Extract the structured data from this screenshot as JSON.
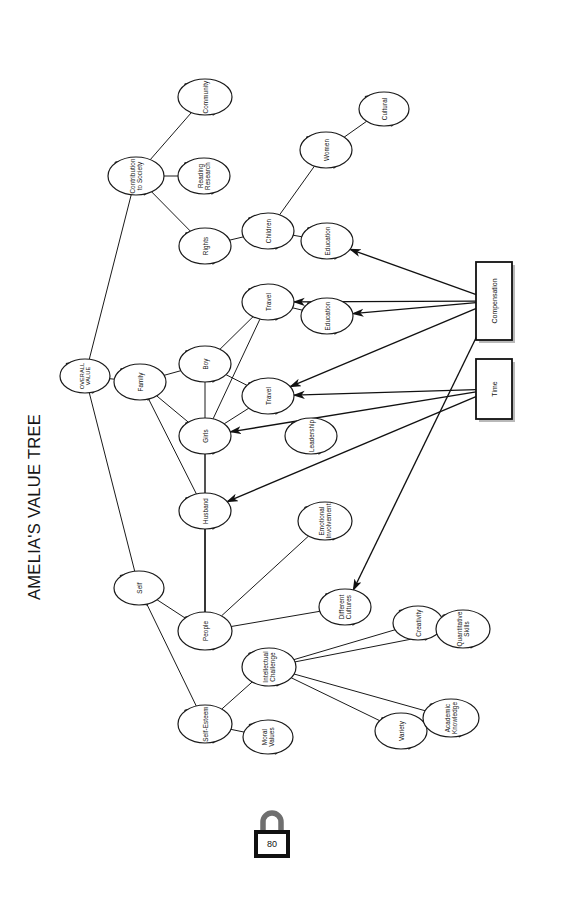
{
  "diagram": {
    "title": "AMELIA'S VALUE TREE",
    "orientation_deg": 90,
    "root": {
      "id": "root",
      "label": "OVERALL\nVALUE",
      "x": 85,
      "y": 376,
      "rx": 25,
      "ry": 17
    },
    "nodes": [
      {
        "id": "contribution",
        "label": "Contribution\nto Society",
        "x": 136,
        "y": 176,
        "rx": 28,
        "ry": 19
      },
      {
        "id": "community",
        "label": "Community",
        "x": 205,
        "y": 97,
        "rx": 27,
        "ry": 18
      },
      {
        "id": "reading",
        "label": "Reading\nResearch",
        "x": 204,
        "y": 176,
        "rx": 26,
        "ry": 18
      },
      {
        "id": "rights",
        "label": "Rights",
        "x": 205,
        "y": 246,
        "rx": 26,
        "ry": 18
      },
      {
        "id": "children",
        "label": "Children",
        "x": 268,
        "y": 231,
        "rx": 26,
        "ry": 18
      },
      {
        "id": "women",
        "label": "Women",
        "x": 326,
        "y": 150,
        "rx": 26,
        "ry": 18
      },
      {
        "id": "cultural",
        "label": "Cultural",
        "x": 384,
        "y": 109,
        "rx": 25,
        "ry": 17
      },
      {
        "id": "education1",
        "label": "Education",
        "x": 327,
        "y": 241,
        "rx": 26,
        "ry": 18
      },
      {
        "id": "family",
        "label": "Family",
        "x": 140,
        "y": 382,
        "rx": 26,
        "ry": 18
      },
      {
        "id": "boy",
        "label": "Boy",
        "x": 205,
        "y": 364,
        "rx": 26,
        "ry": 18
      },
      {
        "id": "girls",
        "label": "Girls",
        "x": 205,
        "y": 436,
        "rx": 26,
        "ry": 18
      },
      {
        "id": "husband",
        "label": "Husband",
        "x": 205,
        "y": 511,
        "rx": 26,
        "ry": 18
      },
      {
        "id": "travel1",
        "label": "Travel",
        "x": 268,
        "y": 302,
        "rx": 26,
        "ry": 18
      },
      {
        "id": "travel2",
        "label": "Travel",
        "x": 268,
        "y": 396,
        "rx": 26,
        "ry": 18
      },
      {
        "id": "education2",
        "label": "Education",
        "x": 327,
        "y": 316,
        "rx": 26,
        "ry": 18
      },
      {
        "id": "leadership",
        "label": "Leadership",
        "x": 311,
        "y": 436,
        "rx": 26,
        "ry": 18
      },
      {
        "id": "self",
        "label": "Self",
        "x": 139,
        "y": 588,
        "rx": 25,
        "ry": 17
      },
      {
        "id": "people",
        "label": "People",
        "x": 205,
        "y": 631,
        "rx": 27,
        "ry": 19
      },
      {
        "id": "selfesteem",
        "label": "Self-Esteem",
        "x": 205,
        "y": 724,
        "rx": 27,
        "ry": 19
      },
      {
        "id": "intellectual",
        "label": "Intellectual\nChallenge",
        "x": 269,
        "y": 667,
        "rx": 27,
        "ry": 19
      },
      {
        "id": "moralvalues",
        "label": "Moral\nValues",
        "x": 268,
        "y": 737,
        "rx": 25,
        "ry": 17
      },
      {
        "id": "emotional",
        "label": "Emotional\nInvolvement",
        "x": 325,
        "y": 521,
        "rx": 27,
        "ry": 19
      },
      {
        "id": "diffcultures",
        "label": "Different\nCultures",
        "x": 345,
        "y": 607,
        "rx": 26,
        "ry": 18
      },
      {
        "id": "creativity",
        "label": "Creativity",
        "x": 418,
        "y": 623,
        "rx": 25,
        "ry": 17
      },
      {
        "id": "quantitative",
        "label": "Quantitative\nSkills",
        "x": 463,
        "y": 629,
        "rx": 27,
        "ry": 19
      },
      {
        "id": "variety",
        "label": "Variety",
        "x": 401,
        "y": 731,
        "rx": 26,
        "ry": 18
      },
      {
        "id": "academic",
        "label": "Academic\nKnowledge",
        "x": 451,
        "y": 718,
        "rx": 28,
        "ry": 19
      }
    ],
    "boxes": [
      {
        "id": "compensation",
        "label": "Compensation",
        "x": 476,
        "y": 262,
        "w": 36,
        "h": 78
      },
      {
        "id": "time",
        "label": "Time",
        "x": 476,
        "y": 359,
        "w": 36,
        "h": 60
      }
    ],
    "edges": [
      [
        "root",
        "contribution"
      ],
      [
        "root",
        "family"
      ],
      [
        "root",
        "self"
      ],
      [
        "contribution",
        "community"
      ],
      [
        "contribution",
        "reading"
      ],
      [
        "contribution",
        "rights"
      ],
      [
        "rights",
        "children"
      ],
      [
        "children",
        "women"
      ],
      [
        "children",
        "education1"
      ],
      [
        "women",
        "cultural"
      ],
      [
        "family",
        "boy"
      ],
      [
        "family",
        "girls"
      ],
      [
        "family",
        "husband"
      ],
      [
        "boy",
        "travel1"
      ],
      [
        "boy",
        "travel2"
      ],
      [
        "girls",
        "travel1"
      ],
      [
        "girls",
        "travel2"
      ],
      [
        "travel1",
        "education2"
      ],
      [
        "self",
        "people"
      ],
      [
        "self",
        "selfesteem"
      ],
      [
        "people",
        "emotional"
      ],
      [
        "people",
        "diffcultures"
      ],
      [
        "people",
        "husband"
      ],
      [
        "people",
        "boy"
      ],
      [
        "people",
        "girls"
      ],
      [
        "selfesteem",
        "intellectual"
      ],
      [
        "selfesteem",
        "moralvalues"
      ],
      [
        "intellectual",
        "creativity"
      ],
      [
        "intellectual",
        "quantitative"
      ],
      [
        "intellectual",
        "variety"
      ],
      [
        "intellectual",
        "academic"
      ]
    ],
    "arrows": [
      {
        "from": "compensation",
        "to": "education1"
      },
      {
        "from": "compensation",
        "to": "education2"
      },
      {
        "from": "compensation",
        "to": "travel1"
      },
      {
        "from": "compensation",
        "to": "travel2"
      },
      {
        "from": "compensation",
        "to": "diffcultures"
      },
      {
        "from": "time",
        "to": "travel2"
      },
      {
        "from": "time",
        "to": "girls"
      },
      {
        "from": "time",
        "to": "husband"
      }
    ],
    "padlock": {
      "value": "80",
      "x": 272,
      "y": 838
    }
  }
}
